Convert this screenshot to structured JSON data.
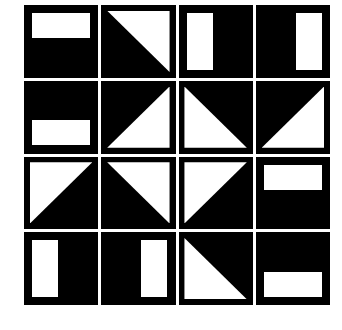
{
  "figure": {
    "background_color": "#ffffff",
    "tile_color": "#000000",
    "shape_color": "#ffffff",
    "rows": 4,
    "columns": 4,
    "tile_count": 16
  },
  "tiles": [
    {
      "id": "tile-r1c1",
      "row": 1,
      "col": 1,
      "shape": "rectangle",
      "variant": "rect-top",
      "label": "white horizontal bar at top"
    },
    {
      "id": "tile-r1c2",
      "row": 1,
      "col": 2,
      "shape": "triangle",
      "variant": "tri tr",
      "label": "white triangle, right angle at top-right"
    },
    {
      "id": "tile-r1c3",
      "row": 1,
      "col": 3,
      "shape": "rectangle",
      "variant": "rect-left",
      "label": "white vertical bar at left"
    },
    {
      "id": "tile-r1c4",
      "row": 1,
      "col": 4,
      "shape": "rectangle",
      "variant": "rect-right",
      "label": "white vertical bar at right"
    },
    {
      "id": "tile-r2c1",
      "row": 2,
      "col": 1,
      "shape": "rectangle",
      "variant": "rect-bottom",
      "label": "white horizontal bar at bottom"
    },
    {
      "id": "tile-r2c2",
      "row": 2,
      "col": 2,
      "shape": "triangle",
      "variant": "tri br",
      "label": "white triangle, right angle at bottom-right"
    },
    {
      "id": "tile-r2c3",
      "row": 2,
      "col": 3,
      "shape": "triangle",
      "variant": "tri bl",
      "label": "white triangle, right angle at bottom-left"
    },
    {
      "id": "tile-r2c4",
      "row": 2,
      "col": 4,
      "shape": "triangle",
      "variant": "tri br",
      "label": "white triangle, right angle at bottom-right"
    },
    {
      "id": "tile-r3c1",
      "row": 3,
      "col": 1,
      "shape": "triangle",
      "variant": "tri tl",
      "label": "white triangle, right angle at top-left"
    },
    {
      "id": "tile-r3c2",
      "row": 3,
      "col": 2,
      "shape": "triangle",
      "variant": "tri tr",
      "label": "white triangle, right angle at top-right"
    },
    {
      "id": "tile-r3c3",
      "row": 3,
      "col": 3,
      "shape": "triangle",
      "variant": "tri tl",
      "label": "white triangle, right angle at top-left"
    },
    {
      "id": "tile-r3c4",
      "row": 3,
      "col": 4,
      "shape": "rectangle",
      "variant": "rect-top",
      "label": "white horizontal bar at top"
    },
    {
      "id": "tile-r4c1",
      "row": 4,
      "col": 1,
      "shape": "rectangle",
      "variant": "rect-left",
      "label": "white vertical bar at left"
    },
    {
      "id": "tile-r4c2",
      "row": 4,
      "col": 2,
      "shape": "rectangle",
      "variant": "rect-right",
      "label": "white vertical bar at right"
    },
    {
      "id": "tile-r4c3",
      "row": 4,
      "col": 3,
      "shape": "triangle",
      "variant": "tri bl",
      "label": "white triangle, right angle at bottom-left"
    },
    {
      "id": "tile-r4c4",
      "row": 4,
      "col": 4,
      "shape": "rectangle",
      "variant": "rect-bottom",
      "label": "white horizontal bar at bottom"
    }
  ]
}
